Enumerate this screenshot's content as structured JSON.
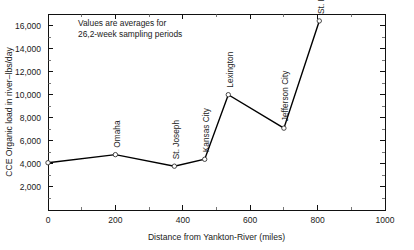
{
  "chart_data": {
    "type": "line",
    "title": "",
    "xlabel": "Distance from Yankton-River (miles)",
    "ylabel": "CCE  Organic load in river–lbs/day",
    "xlim": [
      0,
      1000
    ],
    "ylim": [
      0,
      17000
    ],
    "grid": false,
    "legend": "none",
    "x_ticks": [
      0,
      200,
      400,
      600,
      800,
      1000
    ],
    "x_tick_labels": [
      "0",
      "200",
      "400",
      "600",
      "800",
      "1000"
    ],
    "x_minor_step": 100,
    "y_ticks": [
      2000,
      4000,
      6000,
      8000,
      10000,
      12000,
      14000,
      16000
    ],
    "y_tick_labels": [
      "2,000",
      "4,000",
      "6,000",
      "8,000",
      "10,000",
      "12,000",
      "14,000",
      "16,000"
    ],
    "y_minor_step": 1000,
    "annotations": [
      "Values are averages for",
      "26,2-week sampling periods"
    ],
    "series": [
      {
        "name": "Organic load",
        "points": [
          {
            "label": "",
            "x": 0,
            "y": 4100
          },
          {
            "label": "Omaha",
            "x": 200,
            "y": 4800
          },
          {
            "label": "St. Joseph",
            "x": 375,
            "y": 3800
          },
          {
            "label": "Kansas City",
            "x": 465,
            "y": 4400
          },
          {
            "label": "Lexington",
            "x": 535,
            "y": 10000
          },
          {
            "label": "Jefferson City",
            "x": 700,
            "y": 7100
          },
          {
            "label": "St. Louis",
            "x": 805,
            "y": 16400
          }
        ]
      }
    ],
    "colors": {
      "line": "#000000",
      "marker_fill": "#ffffff",
      "marker_stroke": "#333333",
      "axis": "#111111",
      "text": "#1a1a1a",
      "background": "#ffffff"
    }
  }
}
